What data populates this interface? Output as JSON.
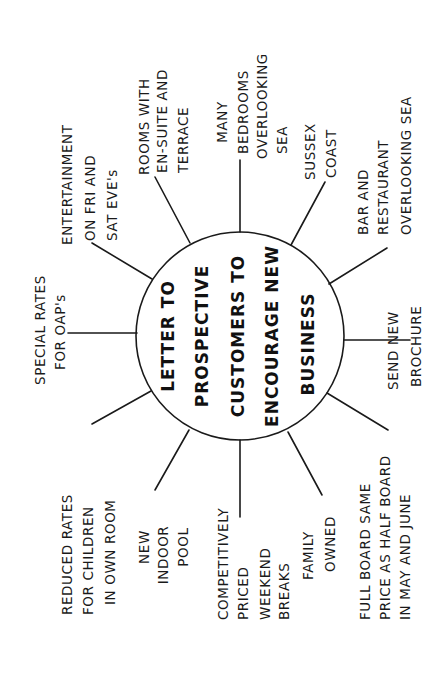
{
  "diagram": {
    "type": "spider-diagram",
    "orientation": "rotated-90-ccw",
    "colors": {
      "ink": "#1a1a1a",
      "paper": "#ffffff"
    },
    "center": {
      "lines": [
        "LETTER TO",
        "PROSPECTIVE",
        "CUSTOMERS TO",
        "ENCOURAGE NEW",
        "BUSINESS"
      ]
    },
    "branches": [
      {
        "id": "special-rates",
        "lines": [
          "SPECIAL RATES",
          "FOR OAP's"
        ]
      },
      {
        "id": "entertainment",
        "lines": [
          "ENTERTAINMENT",
          "ON FRI AND",
          "SAT EVE's"
        ]
      },
      {
        "id": "rooms-ensuite",
        "lines": [
          "ROOMS WITH",
          "EN-SUITE AND",
          "TERRACE"
        ]
      },
      {
        "id": "bedrooms-sea",
        "lines": [
          "MANY",
          "BEDROOMS",
          "OVERLOOKING",
          "SEA"
        ]
      },
      {
        "id": "sussex-coast",
        "lines": [
          "SUSSEX",
          "COAST"
        ]
      },
      {
        "id": "bar-restaurant",
        "lines": [
          "BAR AND",
          "RESTAURANT",
          "OVERLOOKING SEA"
        ]
      },
      {
        "id": "send-brochure",
        "lines": [
          "SEND NEW",
          "BROCHURE"
        ]
      },
      {
        "id": "full-board",
        "lines": [
          "FULL BOARD SAME",
          "PRICE AS HALF BOARD",
          "IN MAY AND JUNE"
        ]
      },
      {
        "id": "family-owned",
        "lines": [
          "FAMILY",
          "OWNED"
        ]
      },
      {
        "id": "weekend-breaks",
        "lines": [
          "COMPETITIVELY",
          "PRICED",
          "WEEKEND",
          "BREAKS"
        ]
      },
      {
        "id": "indoor-pool",
        "lines": [
          "NEW",
          "INDOOR",
          "POOL"
        ]
      },
      {
        "id": "reduced-rates",
        "lines": [
          "REDUCED RATES",
          "FOR CHILDREN",
          "IN OWN ROOM"
        ]
      }
    ]
  }
}
